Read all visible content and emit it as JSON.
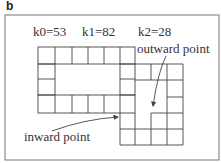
{
  "panel_label": "b",
  "k_labels": [
    "k0=53",
    "k1=82",
    "k2=28"
  ],
  "annotations": {
    "outward": "outward point",
    "inward": "inward point"
  },
  "colors": {
    "line": "#444444",
    "frame": "#777777",
    "text": "#333333"
  }
}
